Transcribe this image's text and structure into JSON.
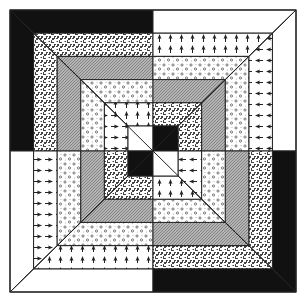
{
  "ring_count": 5,
  "quadrants": [
    {
      "name": "top-left",
      "rings": [
        "black",
        "speckle",
        "hatch",
        "dots",
        "arrows"
      ],
      "center": "white"
    },
    {
      "name": "top-right",
      "rings": [
        "white",
        "arrows",
        "dots",
        "hatch",
        "speckle"
      ],
      "center": "black"
    },
    {
      "name": "bottom-left",
      "rings": [
        "white",
        "arrows",
        "dots",
        "hatch",
        "speckle"
      ],
      "center": "black"
    },
    {
      "name": "bottom-right",
      "rings": [
        "black",
        "speckle",
        "hatch",
        "dots",
        "arrows"
      ],
      "center": "white"
    }
  ],
  "colors": {
    "black": "#111111",
    "white": "#ffffff",
    "line": "#222222",
    "hatch": "#a8a8a8",
    "ink": "#333333"
  }
}
